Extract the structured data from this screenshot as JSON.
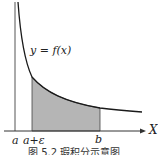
{
  "figure": {
    "function_label": "y = f(x)",
    "x_axis_label": "X",
    "tick_labels": {
      "a": "a",
      "a_eps": "a+ε",
      "b": "b"
    },
    "caption": "图 5.2  瑕积分示意图",
    "colors": {
      "curve": "#1a1a1a",
      "axis": "#333333",
      "asymptote": "#555555",
      "shaded": "#b5b5b5"
    }
  }
}
